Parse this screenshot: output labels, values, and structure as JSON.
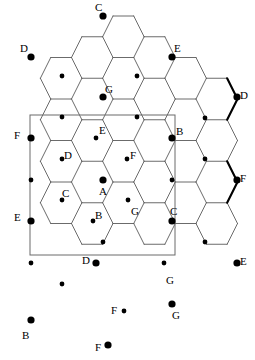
{
  "figure": {
    "type": "diagram",
    "width": 255,
    "height": 360,
    "background_color": "#ffffff",
    "line_color": "#000000",
    "thin_line_color": "#4a4a4a",
    "node_color": "#000000",
    "rect_color": "#555555"
  },
  "fundamental_domain": {
    "name": "selection-rectangle",
    "x": 30,
    "y": 115,
    "width": 145,
    "height": 140,
    "stroke": "#6a6a6a",
    "stroke_width": 1
  },
  "lattice": {
    "hex_width": 41.5,
    "hex_height": 41.5,
    "row_spacing": 20.75,
    "col_spacing": 41.5,
    "origin_x": 30,
    "origin_y": 16
  },
  "labels": [
    {
      "id": "l1",
      "text": "C",
      "x": 95,
      "y": 2,
      "node_x": 103,
      "node_y": 16,
      "big": true
    },
    {
      "id": "l2",
      "text": "D",
      "x": 20,
      "y": 43,
      "node_x": 31,
      "node_y": 57,
      "big": true
    },
    {
      "id": "l3",
      "text": "E",
      "x": 174,
      "y": 43,
      "node_x": 172,
      "node_y": 57,
      "big": true
    },
    {
      "id": "l4",
      "text": "G",
      "x": 105,
      "y": 84,
      "node_x": 103,
      "node_y": 97,
      "big": true
    },
    {
      "id": "l5",
      "text": "D",
      "x": 240,
      "y": 90,
      "node_x": 237,
      "node_y": 97,
      "big": true
    },
    {
      "id": "l6",
      "text": "F",
      "x": 14,
      "y": 130,
      "node_x": 31,
      "node_y": 138,
      "big": true
    },
    {
      "id": "l7",
      "text": "E",
      "x": 99,
      "y": 125,
      "node_x": 96,
      "node_y": 138,
      "big": false
    },
    {
      "id": "l8",
      "text": "B",
      "x": 176,
      "y": 126,
      "node_x": 172,
      "node_y": 138,
      "big": true
    },
    {
      "id": "l9",
      "text": "D",
      "x": 64,
      "y": 150,
      "node_x": 62,
      "node_y": 159,
      "big": false
    },
    {
      "id": "l10",
      "text": "F",
      "x": 130,
      "y": 150,
      "node_x": 127,
      "node_y": 159,
      "big": false
    },
    {
      "id": "l11",
      "text": "F",
      "x": 240,
      "y": 173,
      "node_x": 237,
      "node_y": 180,
      "big": true
    },
    {
      "id": "l12",
      "text": "C",
      "x": 62,
      "y": 188,
      "node_x": 62,
      "node_y": 200,
      "big": false
    },
    {
      "id": "l13",
      "text": "A",
      "x": 99,
      "y": 186,
      "node_x": 103,
      "node_y": 180,
      "big": true
    },
    {
      "id": "l14",
      "text": "E",
      "x": 14,
      "y": 212,
      "node_x": 31,
      "node_y": 221,
      "big": true
    },
    {
      "id": "l15",
      "text": "B",
      "x": 95,
      "y": 210,
      "node_x": 93,
      "node_y": 221,
      "big": false
    },
    {
      "id": "l16",
      "text": "G",
      "x": 131,
      "y": 206,
      "node_x": 128,
      "node_y": 200,
      "big": false
    },
    {
      "id": "l17",
      "text": "C",
      "x": 170,
      "y": 206,
      "node_x": 172,
      "node_y": 221,
      "big": true
    },
    {
      "id": "l18",
      "text": "D",
      "x": 82,
      "y": 255,
      "node_x": 96,
      "node_y": 263,
      "big": true
    },
    {
      "id": "l19",
      "text": "G",
      "x": 166,
      "y": 275,
      "node_x": 164,
      "node_y": 263,
      "big": false
    },
    {
      "id": "l20",
      "text": "E",
      "x": 240,
      "y": 256,
      "node_x": 237,
      "node_y": 263,
      "big": true
    },
    {
      "id": "l21",
      "text": "B",
      "x": 22,
      "y": 330,
      "node_x": 31,
      "node_y": 320,
      "big": true
    },
    {
      "id": "l22",
      "text": "F",
      "x": 111,
      "y": 305,
      "node_x": 124,
      "node_y": 311,
      "big": false
    },
    {
      "id": "l23",
      "text": "G",
      "x": 172,
      "y": 310,
      "node_x": 172,
      "node_y": 304,
      "big": true
    },
    {
      "id": "l24",
      "text": "F",
      "x": 95,
      "y": 342,
      "node_x": 108,
      "node_y": 345,
      "big": true
    }
  ],
  "big_nodes": [
    {
      "x": 103,
      "y": 16
    },
    {
      "x": 31,
      "y": 57
    },
    {
      "x": 172,
      "y": 57
    },
    {
      "x": 103,
      "y": 97
    },
    {
      "x": 237,
      "y": 97
    },
    {
      "x": 31,
      "y": 138
    },
    {
      "x": 172,
      "y": 138
    },
    {
      "x": 237,
      "y": 180
    },
    {
      "x": 103,
      "y": 180
    },
    {
      "x": 31,
      "y": 221
    },
    {
      "x": 172,
      "y": 221
    },
    {
      "x": 96,
      "y": 263
    },
    {
      "x": 237,
      "y": 263
    },
    {
      "x": 31,
      "y": 320
    },
    {
      "x": 172,
      "y": 304
    },
    {
      "x": 108,
      "y": 345
    }
  ],
  "small_nodes": [
    {
      "x": 62,
      "y": 76
    },
    {
      "x": 137,
      "y": 76
    },
    {
      "x": 96,
      "y": 138
    },
    {
      "x": 62,
      "y": 159
    },
    {
      "x": 127,
      "y": 159
    },
    {
      "x": 205,
      "y": 118
    },
    {
      "x": 62,
      "y": 200
    },
    {
      "x": 128,
      "y": 200
    },
    {
      "x": 93,
      "y": 221
    },
    {
      "x": 205,
      "y": 159
    },
    {
      "x": 205,
      "y": 242
    },
    {
      "x": 31,
      "y": 180
    },
    {
      "x": 31,
      "y": 263
    },
    {
      "x": 164,
      "y": 263
    },
    {
      "x": 124,
      "y": 311
    },
    {
      "x": 62,
      "y": 284
    },
    {
      "x": 137,
      "y": 117
    },
    {
      "x": 62,
      "y": 117
    },
    {
      "x": 172,
      "y": 180
    },
    {
      "x": 103,
      "y": 242
    }
  ]
}
